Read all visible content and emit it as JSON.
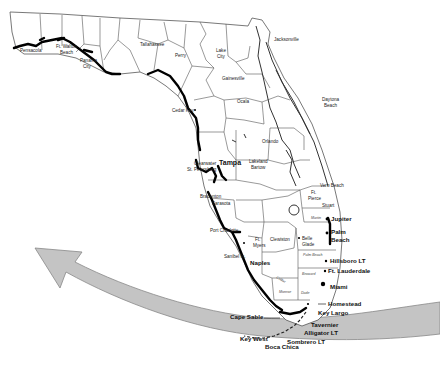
{
  "map": {
    "title": "Florida coastal map",
    "colors": {
      "background": "#ffffff",
      "land": "#ffffff",
      "county_lines": "#555555",
      "highlighted_coast": "#000000",
      "band_fill": "#c4c4c4",
      "band_stroke": "#888888"
    },
    "cities_small": [
      {
        "name": "Pensacola",
        "x": 20,
        "y": 52
      },
      {
        "name": "Ft. Walton",
        "x": 56,
        "y": 48
      },
      {
        "name": "Beach",
        "x": 60,
        "y": 54
      },
      {
        "name": "Panama",
        "x": 80,
        "y": 60
      },
      {
        "name": "City",
        "x": 83,
        "y": 66
      },
      {
        "name": "Tallahassee",
        "x": 140,
        "y": 45
      },
      {
        "name": "Perry",
        "x": 175,
        "y": 57
      },
      {
        "name": "Lake",
        "x": 216,
        "y": 52
      },
      {
        "name": "City",
        "x": 217,
        "y": 58
      },
      {
        "name": "Jacksonville",
        "x": 274,
        "y": 41
      },
      {
        "name": "Gainesville",
        "x": 222,
        "y": 80
      },
      {
        "name": "Ocala",
        "x": 237,
        "y": 102
      },
      {
        "name": "Cedar Key",
        "x": 182,
        "y": 111
      },
      {
        "name": "Daytona",
        "x": 322,
        "y": 101
      },
      {
        "name": "Beach",
        "x": 324,
        "y": 107
      },
      {
        "name": "Orlando",
        "x": 264,
        "y": 143
      },
      {
        "name": "Clearwater",
        "x": 194,
        "y": 163
      },
      {
        "name": "St. Petersburg",
        "x": 187,
        "y": 171
      },
      {
        "name": "Lakeland",
        "x": 249,
        "y": 163
      },
      {
        "name": "Bartow",
        "x": 251,
        "y": 169
      },
      {
        "name": "Vero Beach",
        "x": 320,
        "y": 186
      },
      {
        "name": "Bradenton",
        "x": 200,
        "y": 198
      },
      {
        "name": "Sarasota",
        "x": 212,
        "y": 205
      },
      {
        "name": "Ft.",
        "x": 311,
        "y": 194
      },
      {
        "name": "Pierce",
        "x": 308,
        "y": 200
      },
      {
        "name": "Stuart",
        "x": 322,
        "y": 206
      },
      {
        "name": "Port Charlotte",
        "x": 214,
        "y": 231
      },
      {
        "name": "Ft.",
        "x": 255,
        "y": 241
      },
      {
        "name": "Myers",
        "x": 253,
        "y": 246
      },
      {
        "name": "Clewiston",
        "x": 272,
        "y": 241
      },
      {
        "name": "Belle",
        "x": 308,
        "y": 240
      },
      {
        "name": "Glade",
        "x": 307,
        "y": 246
      },
      {
        "name": "Sanibel Is.",
        "x": 226,
        "y": 257
      }
    ],
    "cities_large": [
      {
        "name": "Tampa",
        "x": 219,
        "y": 164
      },
      {
        "name": "Jupiter",
        "x": 330,
        "y": 219
      },
      {
        "name": "Palm",
        "x": 330,
        "y": 233
      },
      {
        "name": "Beach",
        "x": 330,
        "y": 241
      },
      {
        "name": "Hillsboro LT",
        "x": 330,
        "y": 262
      },
      {
        "name": "Ft. Lauderdale",
        "x": 328,
        "y": 272
      },
      {
        "name": "Miami",
        "x": 331,
        "y": 288
      },
      {
        "name": "Naples",
        "x": 250,
        "y": 264
      },
      {
        "name": "Homestead",
        "x": 329,
        "y": 305
      },
      {
        "name": "Key Largo",
        "x": 320,
        "y": 315
      },
      {
        "name": "Cape Sable",
        "x": 232,
        "y": 318
      },
      {
        "name": "Tavernier",
        "x": 310,
        "y": 326
      },
      {
        "name": "Alligator LT",
        "x": 303,
        "y": 334
      },
      {
        "name": "Sombrero LT",
        "x": 287,
        "y": 343
      },
      {
        "name": "Key West",
        "x": 240,
        "y": 340
      },
      {
        "name": "Boca Chica",
        "x": 265,
        "y": 348
      }
    ],
    "county_names": [
      {
        "name": "Martin",
        "x": 312,
        "y": 219
      },
      {
        "name": "Palm Beach",
        "x": 300,
        "y": 256
      },
      {
        "name": "Broward",
        "x": 300,
        "y": 275
      },
      {
        "name": "Collier",
        "x": 278,
        "y": 280
      },
      {
        "name": "Monroe",
        "x": 280,
        "y": 292
      },
      {
        "name": "Dade",
        "x": 302,
        "y": 294
      }
    ],
    "arrow": {
      "direction": "west-northwest",
      "description": "curved gray band sweeping from east across the Florida Keys to a point in the Gulf"
    }
  }
}
